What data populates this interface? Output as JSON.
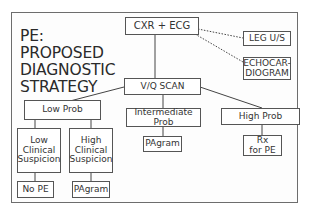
{
  "diagram": {
    "title_lines": [
      "PE:",
      "PROPOSED",
      "DIAGNOSTIC",
      "STRATEGY"
    ],
    "nodes": {
      "cxr_ecg": "CXR + ECG",
      "leg_us": "LEG U/S",
      "echo_line1": "ECHOCAR-",
      "echo_line2": "DIOGRAM",
      "vq_scan": "V/Q SCAN",
      "low_prob": "Low Prob",
      "intermediate_line1": "Intermediate",
      "intermediate_line2": "Prob",
      "high_prob": "High Prob",
      "low_clin_line1": "Low",
      "low_clin_line2": "Clinical",
      "low_clin_line3": "Suspicion",
      "high_clin_line1": "High",
      "high_clin_line2": "Clinical",
      "high_clin_line3": "Suspicion",
      "no_pe": "No PE",
      "pagram_low": "PAgram",
      "pagram_intermediate": "PAgram",
      "rx_line1": "Rx",
      "rx_line2": "for PE"
    },
    "edges": [
      {
        "from": "CXR + ECG",
        "to": "V/Q SCAN",
        "style": "solid"
      },
      {
        "from": "CXR + ECG",
        "to": "LEG U/S",
        "style": "dotted"
      },
      {
        "from": "CXR + ECG",
        "to": "ECHOCARDIOGRAM",
        "style": "dotted"
      },
      {
        "from": "V/Q SCAN",
        "to": "Low Prob",
        "style": "solid"
      },
      {
        "from": "V/Q SCAN",
        "to": "Intermediate Prob",
        "style": "solid"
      },
      {
        "from": "V/Q SCAN",
        "to": "High Prob",
        "style": "solid"
      },
      {
        "from": "Low Prob",
        "to": "Low Clinical Suspicion",
        "style": "solid"
      },
      {
        "from": "Low Prob",
        "to": "High Clinical Suspicion",
        "style": "solid"
      },
      {
        "from": "Low Clinical Suspicion",
        "to": "No PE",
        "style": "solid"
      },
      {
        "from": "High Clinical Suspicion",
        "to": "PAgram",
        "style": "solid"
      },
      {
        "from": "Intermediate Prob",
        "to": "PAgram",
        "style": "solid"
      },
      {
        "from": "High Prob",
        "to": "Rx for PE",
        "style": "solid"
      }
    ]
  }
}
